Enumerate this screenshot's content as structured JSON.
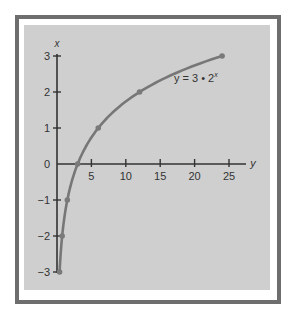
{
  "chart_data": {
    "type": "line",
    "title": "",
    "equation_label": "y = 3 • 2",
    "equation_exponent": "x",
    "xlabel": "y",
    "ylabel": "x",
    "x_axis": {
      "variable": "y",
      "ticks": [
        5,
        10,
        15,
        20,
        25
      ],
      "range": [
        0,
        27
      ]
    },
    "y_axis": {
      "variable": "x",
      "ticks": [
        3,
        2,
        1,
        0,
        -1,
        -2,
        -3
      ],
      "range": [
        -3,
        3
      ]
    },
    "series": [
      {
        "name": "y = 3 • 2^x",
        "points": [
          {
            "y": 0.375,
            "x": -3
          },
          {
            "y": 0.75,
            "x": -2
          },
          {
            "y": 1.5,
            "x": -1
          },
          {
            "y": 3,
            "x": 0
          },
          {
            "y": 6,
            "x": 1
          },
          {
            "y": 12,
            "x": 2
          },
          {
            "y": 24,
            "x": 3
          }
        ]
      }
    ],
    "grid": false,
    "legend": "inline label near curve"
  },
  "colors": {
    "frame": "#6e6e6e",
    "panel": "#cfcfcf",
    "axis": "#333333",
    "curve": "#777777",
    "point": "#7a7a7a",
    "text": "#333333"
  }
}
